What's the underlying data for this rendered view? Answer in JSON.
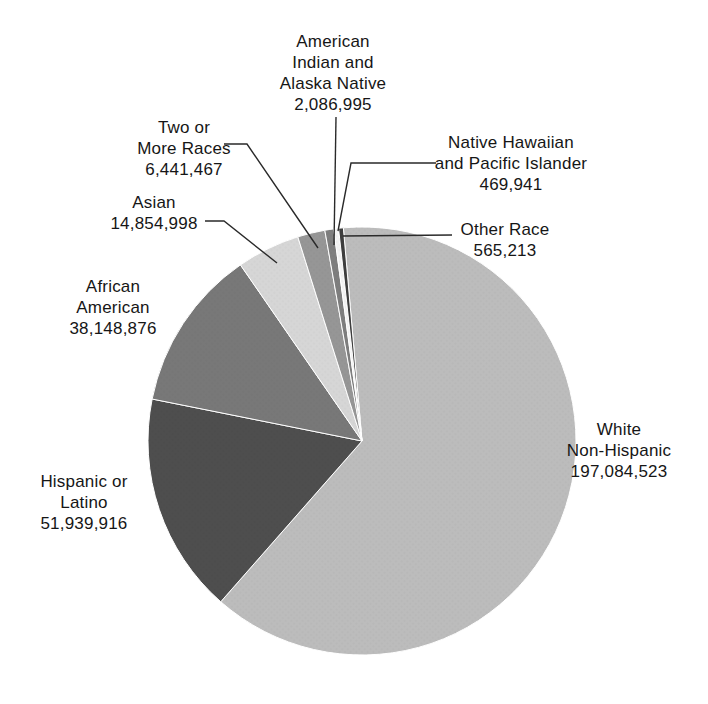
{
  "figure": {
    "background": "#ffffff",
    "leader_line_color": "#2a2a2a"
  },
  "chart_data": {
    "type": "pie",
    "title": "",
    "legend_position": "none",
    "label_style": "outside-with-leader-lines",
    "total": 311591929,
    "slices": [
      {
        "key": "white-non-hispanic",
        "name": "White Non-Hispanic",
        "value": 197084523,
        "value_text": "197,084,523",
        "label_lines": [
          "White",
          "Non-Hispanic",
          "197,084,523"
        ],
        "color": "#bcbcbc"
      },
      {
        "key": "hispanic-or-latino",
        "name": "Hispanic or Latino",
        "value": 51939916,
        "value_text": "51,939,916",
        "label_lines": [
          "Hispanic or",
          "Latino",
          "51,939,916"
        ],
        "color": "#4e4e4e"
      },
      {
        "key": "african-american",
        "name": "African American",
        "value": 38148876,
        "value_text": "38,148,876",
        "label_lines": [
          "African",
          "American",
          "38,148,876"
        ],
        "color": "#787878"
      },
      {
        "key": "asian",
        "name": "Asian",
        "value": 14854998,
        "value_text": "14,854,998",
        "label_lines": [
          "Asian",
          "14,854,998"
        ],
        "color": "#d6d6d6"
      },
      {
        "key": "two-or-more-races",
        "name": "Two or More Races",
        "value": 6441467,
        "value_text": "6,441,467",
        "label_lines": [
          "Two or",
          "More Races",
          "6,441,467"
        ],
        "color": "#969696"
      },
      {
        "key": "american-indian-alaska-native",
        "name": "American Indian and Alaska Native",
        "value": 2086995,
        "value_text": "2,086,995",
        "label_lines": [
          "American",
          "Indian and",
          "Alaska Native",
          "2,086,995"
        ],
        "color": "#7e7e7e"
      },
      {
        "key": "native-hawaiian-pacific-islander",
        "name": "Native Hawaiian and Pacific Islander",
        "value": 469941,
        "value_text": "469,941",
        "label_lines": [
          "Native Hawaiian",
          "and Pacific Islander",
          "469,941"
        ],
        "color": "#f3f3f3"
      },
      {
        "key": "other-race",
        "name": "Other Race",
        "value": 565213,
        "value_text": "565,213",
        "label_lines": [
          "Other Race",
          "565,213"
        ],
        "color": "#3e3e3e"
      }
    ]
  }
}
